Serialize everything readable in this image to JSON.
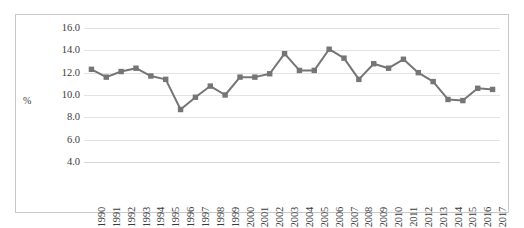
{
  "chart_data": {
    "type": "line",
    "title": "",
    "xlabel": "",
    "ylabel": "%",
    "ylim": [
      4.0,
      16.0
    ],
    "ytick_step": 2.0,
    "ytick_labels": [
      "16.0",
      "14.0",
      "12.0",
      "10.0",
      "8.0",
      "6.0",
      "4.0"
    ],
    "ytick_values": [
      16.0,
      14.0,
      12.0,
      10.0,
      8.0,
      6.0,
      4.0
    ],
    "grid": true,
    "legend": "none",
    "marker": "square",
    "series_color": "#757575",
    "gridline_color": "#e3e3e3",
    "border_color": "#c9c9c9",
    "background_color": "#ffffff",
    "categories": [
      "1990",
      "1991",
      "1992",
      "1993",
      "1994",
      "1995",
      "1996",
      "1997",
      "1998",
      "1999",
      "2000",
      "2001",
      "2002",
      "2003",
      "2004",
      "2005",
      "2006",
      "2007",
      "2008",
      "2009",
      "2010",
      "2011",
      "2012",
      "2013",
      "2014",
      "2015",
      "2016",
      "2017"
    ],
    "values": [
      12.3,
      11.6,
      12.1,
      12.4,
      11.7,
      11.4,
      8.7,
      9.8,
      10.8,
      10.0,
      11.6,
      11.6,
      11.9,
      13.7,
      12.2,
      12.2,
      14.1,
      13.3,
      11.4,
      12.8,
      12.4,
      13.2,
      12.0,
      11.2,
      9.6,
      9.5,
      10.6,
      10.5
    ]
  }
}
